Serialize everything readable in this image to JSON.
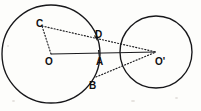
{
  "figure": {
    "type": "geometry-diagram",
    "canvas": {
      "width": 201,
      "height": 111,
      "background": "#fdfdfb"
    },
    "stroke_color": "#17171a",
    "label_color": "#0e0e10",
    "labels": [
      {
        "id": "label-C",
        "text": "C",
        "x": 36,
        "y": 19
      },
      {
        "id": "label-D",
        "text": "D",
        "x": 95,
        "y": 30
      },
      {
        "id": "label-O",
        "text": "O",
        "x": 45,
        "y": 57
      },
      {
        "id": "label-A",
        "text": "A",
        "x": 96,
        "y": 57
      },
      {
        "id": "label-Op",
        "text": "O'",
        "x": 155,
        "y": 57
      },
      {
        "id": "label-B",
        "text": "B",
        "x": 89,
        "y": 81
      }
    ],
    "circles": [
      {
        "id": "circle-O",
        "cx": 51,
        "cy": 54,
        "r": 49
      },
      {
        "id": "circle-Oprime",
        "cx": 156,
        "cy": 52,
        "r": 36
      }
    ],
    "points": [
      {
        "id": "point-C",
        "x": 42,
        "y": 26
      },
      {
        "id": "point-D",
        "x": 96,
        "y": 38
      },
      {
        "id": "point-O",
        "x": 51,
        "y": 54
      },
      {
        "id": "point-A",
        "x": 99,
        "y": 54
      },
      {
        "id": "point-Oprime",
        "x": 156,
        "y": 52
      },
      {
        "id": "point-B",
        "x": 96,
        "y": 77
      }
    ],
    "segments": [
      {
        "id": "seg-O-Oprime",
        "style": "solid",
        "from": "O",
        "to": "Oprime"
      },
      {
        "id": "seg-O-C",
        "style": "dotted",
        "from": "O",
        "to": "C"
      },
      {
        "id": "seg-C-Oprime",
        "style": "dotted",
        "from": "C",
        "to": "Oprime"
      },
      {
        "id": "seg-D-Oprime",
        "style": "dotted",
        "from": "D",
        "to": "Oprime"
      },
      {
        "id": "seg-B-Oprime",
        "style": "dotted",
        "from": "B",
        "to": "Oprime"
      }
    ]
  }
}
